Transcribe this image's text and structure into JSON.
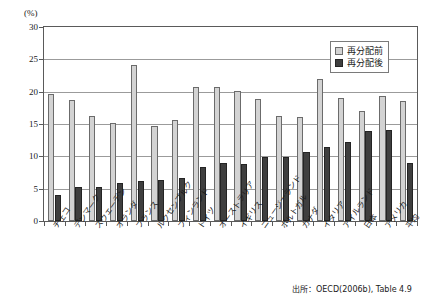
{
  "figure": {
    "unit_label": "(%)",
    "source_note": "出所：OECD(2006b), Table 4.9"
  },
  "legend": {
    "position": "top-right-inside",
    "entries": [
      {
        "label": "再分配前",
        "color": "#d3d3d3",
        "key": "pre"
      },
      {
        "label": "再分配後",
        "color": "#3f3f3f",
        "key": "post"
      }
    ]
  },
  "axis": {
    "y_ticks": [
      "0",
      "5",
      "10",
      "15",
      "20",
      "25",
      "30"
    ]
  },
  "chart_data": {
    "type": "bar",
    "title": "",
    "subtitle": "",
    "xlabel": "",
    "ylabel": "(%)",
    "ylim": [
      0,
      30
    ],
    "ytick_step": 5,
    "grid": true,
    "legend_position": "upper right",
    "annotations": [
      "出所：OECD(2006b), Table 4.9"
    ],
    "categories": [
      "チェコ",
      "デンマーク",
      "スウェーデン",
      "オランダ",
      "フランス",
      "ルクセンブルク",
      "フィンランド",
      "ドイツ",
      "オーストラリア",
      "イギリス",
      "ニュージーランド",
      "ポルトガル",
      "カナダ",
      "イタリア",
      "アイルランド",
      "日本",
      "アメリカ",
      "平均"
    ],
    "series": [
      {
        "name": "再分配前",
        "color": "#d3d3d3",
        "values": [
          19.7,
          18.7,
          16.3,
          15.1,
          24.2,
          14.7,
          15.6,
          20.7,
          20.7,
          20.1,
          18.8,
          16.2,
          16.1,
          22.0,
          19.1,
          17.0,
          19.3,
          18.6
        ]
      },
      {
        "name": "再分配後",
        "color": "#3f3f3f",
        "values": [
          4.0,
          5.2,
          5.3,
          5.9,
          6.2,
          6.3,
          6.7,
          8.3,
          9.0,
          8.8,
          9.9,
          9.9,
          10.6,
          11.4,
          12.2,
          13.9,
          14.0,
          9.0
        ]
      }
    ]
  }
}
